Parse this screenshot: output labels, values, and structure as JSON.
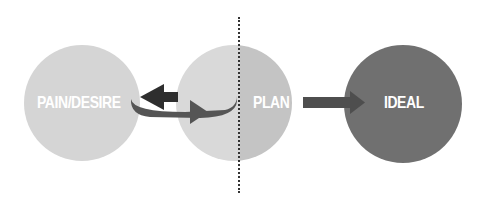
{
  "diagram": {
    "nodes": [
      {
        "id": "pain",
        "label": "PAIN/DESIRE",
        "color": "#d5d5d5"
      },
      {
        "id": "plan",
        "label": "PLAN",
        "color": "#c4c4c4"
      },
      {
        "id": "ideal",
        "label": "IDEAL",
        "color": "#707070"
      }
    ],
    "connectors": [
      {
        "from": "pain",
        "to": "middle",
        "type": "cycle-arrow",
        "colors": [
          "#3a3a3a",
          "#5a5a5a"
        ]
      },
      {
        "from": "plan",
        "to": "ideal",
        "type": "straight-arrow",
        "color": "#555555"
      }
    ],
    "divider": {
      "style": "dotted",
      "color": "#333333"
    }
  }
}
